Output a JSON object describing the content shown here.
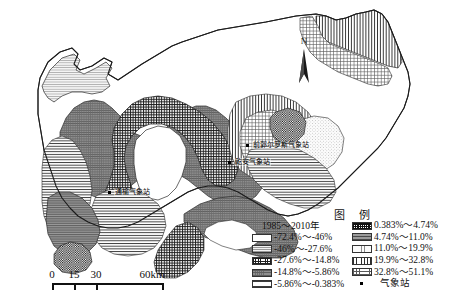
{
  "figure": {
    "type": "thematic-choropleth-map",
    "north_arrow_label": "N"
  },
  "scalebar": {
    "ticks": [
      "0",
      "15",
      "30",
      "60km"
    ],
    "tick_positions": [
      0,
      18,
      36,
      112
    ]
  },
  "legend": {
    "title": "图  例",
    "period_header": "1985～2010年",
    "left_items": [
      {
        "label": "-72.4%～-46%",
        "pattern": "p-blank"
      },
      {
        "label": "-46%～-27.6%",
        "pattern": "p-hdash"
      },
      {
        "label": "-27.6%～-14.8%",
        "pattern": "p-crossdense"
      },
      {
        "label": "-14.8%～-5.86%",
        "pattern": "p-graystipple"
      },
      {
        "label": "-5.86%～-0.383%",
        "pattern": "p-hline"
      }
    ],
    "right_items": [
      {
        "label": "0.383%～4.74%",
        "pattern": "p-checker"
      },
      {
        "label": "4.74%～11.0%",
        "pattern": "p-midgray"
      },
      {
        "label": "11.0%～19.9%",
        "pattern": "p-dot"
      },
      {
        "label": "19.9%～32.8%",
        "pattern": "p-vline"
      },
      {
        "label": "32.8%～51.1%",
        "pattern": "p-finegrid"
      }
    ],
    "point_item": {
      "label": "气象站",
      "pattern": "dot-marker"
    }
  },
  "stations": [
    {
      "name": "通榆气象站",
      "x": 108,
      "y": 190
    },
    {
      "name": "前郭尔罗斯气象站",
      "x": 246,
      "y": 143
    },
    {
      "name": "乾安气象站",
      "x": 228,
      "y": 160
    }
  ],
  "colors": {
    "outline": "#2b2b2b",
    "background": "#ffffff",
    "text": "#111111"
  }
}
